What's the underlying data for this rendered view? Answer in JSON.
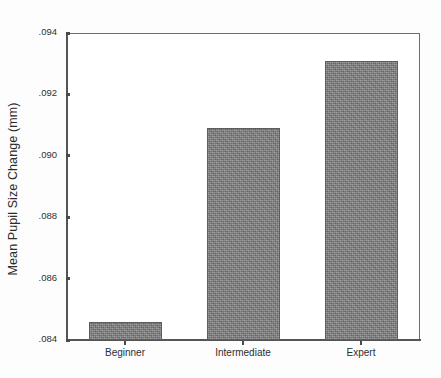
{
  "chart_data": {
    "type": "bar",
    "title": "",
    "xlabel": "",
    "ylabel": "Mean Pupil Size Change (mm)",
    "categories": [
      "Beginner",
      "Intermediate",
      "Expert"
    ],
    "values": [
      0.0846,
      0.0909,
      0.0931
    ],
    "ylim": [
      0.084,
      0.094
    ],
    "yticks": [
      0.084,
      0.086,
      0.088,
      0.09,
      0.092,
      0.094
    ],
    "ytick_labels": [
      ".084",
      ".086",
      ".088",
      ".090",
      ".092",
      ".094"
    ],
    "grid": false,
    "legend": false,
    "bar_color": "#828282",
    "bar_edge_color": "#5d5d5d",
    "axis_color": "#555555",
    "background_color": "#ffffff"
  }
}
